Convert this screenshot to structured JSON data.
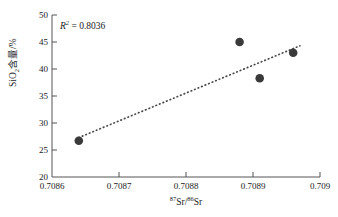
{
  "chart_data": {
    "type": "scatter",
    "title": "",
    "xlabel": "87Sr/86Sr",
    "ylabel": "SiO2含量/%",
    "xlabel_parts": {
      "sup1": "87",
      "base1": "Sr/",
      "sup2": "86",
      "base2": "Sr"
    },
    "ylabel_parts": {
      "base1": "SiO",
      "sub1": "2",
      "base2": "含量/%"
    },
    "x": [
      0.70864,
      0.70888,
      0.70891,
      0.70896
    ],
    "values": [
      26.7,
      45.0,
      38.3,
      43.0
    ],
    "points": [
      {
        "x": 0.70864,
        "y": 26.7
      },
      {
        "x": 0.70888,
        "y": 45.0
      },
      {
        "x": 0.70891,
        "y": 38.3
      },
      {
        "x": 0.70896,
        "y": 43.0
      }
    ],
    "xlim": [
      0.7086,
      0.709
    ],
    "ylim": [
      20,
      50
    ],
    "xticks": [
      0.7086,
      0.7087,
      0.7088,
      0.7089,
      0.709
    ],
    "xtick_labels": [
      "0.7086",
      "0.7087",
      "0.7088",
      "0.7089",
      "0.709"
    ],
    "yticks": [
      20,
      25,
      30,
      35,
      40,
      45,
      50
    ],
    "ytick_labels": [
      "20",
      "25",
      "30",
      "35",
      "40",
      "45",
      "50"
    ],
    "grid": false,
    "legend": false,
    "marker_color": "#3a3a3a",
    "axis_color": "#555555",
    "trendline": {
      "style": "dotted",
      "color": "#4a4a4a",
      "x_start": 0.70864,
      "y_start": 27.3,
      "x_end": 0.70897,
      "y_end": 44.3
    },
    "annotations": [
      {
        "name": "r-squared",
        "symbol": "R",
        "exponent": "2",
        "equals": " = ",
        "value": "0.8036",
        "text": "R² = 0.8036"
      }
    ]
  }
}
